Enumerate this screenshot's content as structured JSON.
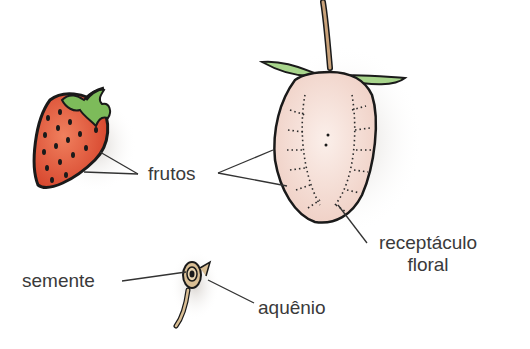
{
  "diagram": {
    "labels": {
      "fruits": "frutos",
      "receptacle_line1": "receptáculo",
      "receptacle_line2": "floral",
      "seed": "semente",
      "achene": "aquênio"
    },
    "figures": [
      {
        "id": "whole-strawberry",
        "description": "whole red strawberry with green sepals and dark seeds"
      },
      {
        "id": "strawberry-cross-section",
        "description": "longitudinal section of strawberry showing pale pink floral receptacle, stem and sepals"
      },
      {
        "id": "achene",
        "description": "single achene with seed inside"
      }
    ],
    "colors": {
      "strawberry_red": "#e0553a",
      "leaf_green": "#7dbb5a",
      "section_pink": "#f3d9d0",
      "stem_tan": "#c9a27a",
      "outline": "#1a1a1a",
      "label_text": "#3a3a3a"
    }
  }
}
